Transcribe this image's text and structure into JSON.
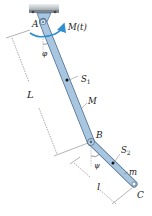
{
  "diagram": {
    "labels": {
      "point_a": "A",
      "point_b": "B",
      "point_c": "C",
      "moment": "M(t)",
      "angle_phi": "φ",
      "angle_psi": "ψ",
      "centroid_1": "S",
      "centroid_1_sub": "1",
      "centroid_2": "S",
      "centroid_2_sub": "2",
      "mass_1": "M",
      "mass_2": "m",
      "length_1": "L",
      "length_2": "l"
    },
    "colors": {
      "rod_fill": "#a9c6e0",
      "rod_stroke": "#4a6c8c",
      "moment_arrow": "#2f8fcf",
      "ceiling": "#b0b6bb",
      "dimension_line": "#555555",
      "text": "#222222"
    }
  }
}
